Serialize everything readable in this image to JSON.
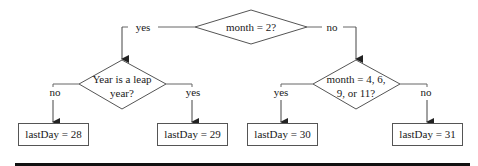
{
  "flowchart": {
    "root": {
      "text": "month = 2?"
    },
    "root_yes_label": "yes",
    "root_no_label": "no",
    "leap_decision": {
      "line1": "Year is a leap",
      "line2": "year?"
    },
    "leap_no_label": "no",
    "leap_yes_label": "yes",
    "month_decision": {
      "line1": "month = 4, 6,",
      "line2": "9, or 11?"
    },
    "month_yes_label": "yes",
    "month_no_label": "no",
    "results": [
      {
        "text": "lastDay = 28"
      },
      {
        "text": "lastDay = 29"
      },
      {
        "text": "lastDay = 30"
      },
      {
        "text": "lastDay = 31"
      }
    ]
  },
  "colors": {
    "line": "#444444",
    "text": "#1a1a1a",
    "rule": "#111111"
  }
}
